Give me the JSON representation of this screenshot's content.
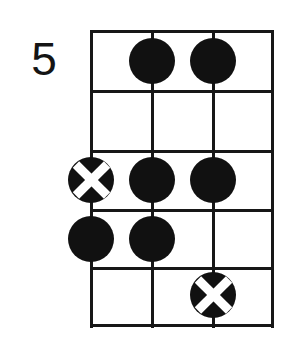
{
  "diagram": {
    "type": "guitar-chord-diagram",
    "instrument_strings_shown": 3,
    "position_label": "5",
    "colors": {
      "ink": "#111111",
      "grid": "#171717",
      "background": "#ffffff",
      "cross": "#ffffff"
    },
    "geometry": {
      "left": 91,
      "right": 272,
      "top": 31,
      "bottom": 325,
      "string_x": [
        91,
        152,
        213,
        272
      ],
      "fret_y": [
        31,
        91,
        151,
        210,
        268,
        325
      ],
      "dot_diameter": 46,
      "line_thickness": 3
    },
    "strings": [
      {
        "index": 1,
        "x": 91
      },
      {
        "index": 2,
        "x": 152
      },
      {
        "index": 3,
        "x": 213
      },
      {
        "index": 4,
        "x": 272
      }
    ],
    "frets": [
      {
        "index": 1,
        "top": 31,
        "bottom": 91,
        "center": 61
      },
      {
        "index": 2,
        "top": 91,
        "bottom": 151,
        "center": 121
      },
      {
        "index": 3,
        "top": 151,
        "bottom": 210,
        "center": 180
      },
      {
        "index": 4,
        "top": 210,
        "bottom": 268,
        "center": 239
      },
      {
        "index": 5,
        "top": 268,
        "bottom": 325,
        "center": 296
      }
    ],
    "markers": [
      {
        "name": "dot-fret1-string2",
        "kind": "filled-dot",
        "fret": 1,
        "string": 2,
        "cx": 152,
        "cy": 61
      },
      {
        "name": "dot-fret1-string3",
        "kind": "filled-dot",
        "fret": 1,
        "string": 3,
        "cx": 213,
        "cy": 61
      },
      {
        "name": "cross-fret3-string1",
        "kind": "crossed-dot",
        "fret": 3,
        "string": 1,
        "cx": 91,
        "cy": 180
      },
      {
        "name": "dot-fret3-string2",
        "kind": "filled-dot",
        "fret": 3,
        "string": 2,
        "cx": 152,
        "cy": 180
      },
      {
        "name": "dot-fret3-string3",
        "kind": "filled-dot",
        "fret": 3,
        "string": 3,
        "cx": 213,
        "cy": 180
      },
      {
        "name": "dot-fret4-string1",
        "kind": "filled-dot",
        "fret": 4,
        "string": 1,
        "cx": 91,
        "cy": 239
      },
      {
        "name": "dot-fret4-string2",
        "kind": "filled-dot",
        "fret": 4,
        "string": 2,
        "cx": 152,
        "cy": 239
      },
      {
        "name": "cross-fret5-string3",
        "kind": "crossed-dot",
        "fret": 5,
        "string": 3,
        "cx": 213,
        "cy": 295
      }
    ]
  }
}
